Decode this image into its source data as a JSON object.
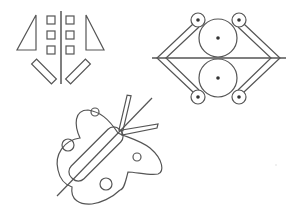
{
  "figures": [
    {
      "id": "symmetric-shapes",
      "description": "Vertical axis with mirrored triangles, squares and rotated rectangles"
    },
    {
      "id": "gear-linkage",
      "description": "Horizontal axis with two large circles and four small pivot circles linked by bars"
    },
    {
      "id": "butterfly",
      "description": "Butterfly outline with diagonal body, circles on wings and crossing line"
    }
  ],
  "colors": {
    "stroke": "#555555",
    "background": "#ffffff"
  }
}
